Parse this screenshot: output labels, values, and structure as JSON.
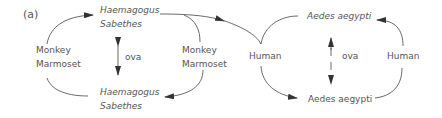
{
  "panel_label": "(a)",
  "sylvatic_cycle": {
    "vector_top": {
      "line1": "Haemagogus",
      "line2": "Sabethes"
    },
    "vector_bottom": {
      "line1": "Haemagogus",
      "line2": "Sabethes"
    },
    "host_left": {
      "line1": "Monkey",
      "line2": "Marmoset"
    },
    "host_right": {
      "line1": "Monkey",
      "line2": "Marmoset"
    },
    "transmission_label": "ova"
  },
  "urban_cycle": {
    "vector_top": "Aedes aegypti",
    "vector_bottom": "Aedes aegypti",
    "host_left": "Human",
    "host_right": "Human",
    "transmission_label": "ova"
  },
  "colors": {
    "line": "#333333",
    "text": "#555555"
  }
}
